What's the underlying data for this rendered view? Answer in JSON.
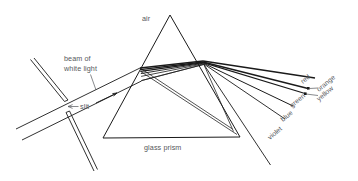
{
  "diagram": {
    "background_color": "#ffffff",
    "line_color": "#1a1a1a",
    "text_color": "#55585c",
    "width": 358,
    "height": 181,
    "labels": {
      "air": "air",
      "beam_line1": "beam of",
      "beam_line2": "white light",
      "slit": "slit",
      "glass_prism": "glass prism",
      "red": "red",
      "orange": "orange",
      "yellow": "yellow",
      "green": "green",
      "blue": "blue",
      "violet": "violet"
    },
    "spectrum_order": [
      "red",
      "orange",
      "yellow",
      "green",
      "blue",
      "violet"
    ],
    "geometry": {
      "prism_apex": "170,15",
      "prism_bottom_left": "103,138",
      "prism_bottom_right": "240,137",
      "entry_point": "140,68",
      "exit_point": "203,62",
      "slit_gap_center": "66,107"
    }
  }
}
